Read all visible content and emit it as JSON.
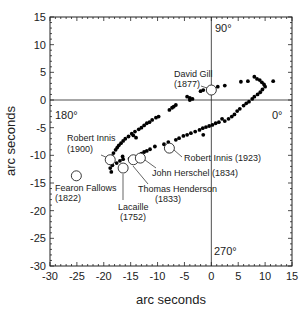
{
  "chart_data": {
    "type": "scatter",
    "title": "",
    "xlabel": "arc seconds",
    "ylabel": "arc seconds",
    "xlim": [
      -30,
      15
    ],
    "ylim": [
      -30,
      15
    ],
    "xticks": [
      -30,
      -25,
      -20,
      -15,
      -10,
      -5,
      0,
      5,
      10,
      15
    ],
    "yticks": [
      -30,
      -25,
      -20,
      -15,
      -10,
      -5,
      0,
      5,
      10,
      15
    ],
    "xtick_labels": [
      "-30",
      "-25",
      "-20",
      "-15",
      "-10",
      "-5",
      "0",
      "5",
      "10",
      "15"
    ],
    "ytick_labels": [
      "-30",
      "-25",
      "-20",
      "-15",
      "-10",
      "-5",
      "0",
      "5",
      "10",
      "15"
    ],
    "grid": false,
    "crosshair": {
      "x": 0,
      "y": 0
    },
    "quadrant_labels": [
      {
        "text": "90°",
        "x": 1,
        "y": 12.5
      },
      {
        "text": "180°",
        "x": -28,
        "y": -2.5
      },
      {
        "text": "0°",
        "x": 11.5,
        "y": -2.5
      },
      {
        "text": "270°",
        "x": 0.8,
        "y": -27.5
      }
    ],
    "series": [
      {
        "name": "observations",
        "marker": "filled-circle",
        "color": "#000000",
        "points": [
          [
            -18.5,
            -10.2
          ],
          [
            -18.2,
            -9.6
          ],
          [
            -17.8,
            -9.0
          ],
          [
            -17.5,
            -8.6
          ],
          [
            -17.2,
            -8.2
          ],
          [
            -16.8,
            -7.8
          ],
          [
            -16.4,
            -7.4
          ],
          [
            -16.0,
            -7.0
          ],
          [
            -15.4,
            -6.6
          ],
          [
            -14.8,
            -6.1
          ],
          [
            -14.2,
            -5.7
          ],
          [
            -13.5,
            -5.3
          ],
          [
            -13.0,
            -5.0
          ],
          [
            -14.0,
            -6.8
          ],
          [
            -12.5,
            -4.6
          ],
          [
            -11.0,
            -3.6
          ],
          [
            -10.3,
            -3.2
          ],
          [
            -9.8,
            -3.0
          ],
          [
            -7.8,
            -1.8
          ],
          [
            -7.3,
            -1.4
          ],
          [
            -7.0,
            -1.2
          ],
          [
            -6.6,
            -0.9
          ],
          [
            -4.5,
            0.6
          ],
          [
            -4.0,
            0.4
          ],
          [
            -2.0,
            1.6
          ],
          [
            -1.5,
            1.8
          ],
          [
            1.2,
            2.4
          ],
          [
            2.5,
            2.6
          ],
          [
            5.5,
            3.3
          ],
          [
            6.8,
            3.4
          ],
          [
            8.0,
            4.2
          ],
          [
            8.5,
            3.8
          ],
          [
            9.0,
            3.6
          ],
          [
            9.4,
            3.2
          ],
          [
            9.8,
            2.8
          ],
          [
            10.0,
            2.4
          ],
          [
            11.5,
            3.4
          ],
          [
            9.5,
            1.9
          ],
          [
            9.1,
            1.4
          ],
          [
            8.6,
            1.0
          ],
          [
            8.0,
            0.6
          ],
          [
            7.6,
            0.2
          ],
          [
            7.0,
            -0.3
          ],
          [
            6.5,
            -0.6
          ],
          [
            6.0,
            -1.0
          ],
          [
            5.3,
            -1.6
          ],
          [
            4.8,
            -2.0
          ],
          [
            4.3,
            -2.6
          ],
          [
            3.8,
            -3.0
          ],
          [
            3.2,
            -3.4
          ],
          [
            2.5,
            -3.8
          ],
          [
            2.0,
            -3.4
          ],
          [
            1.4,
            -4.0
          ],
          [
            0.8,
            -4.2
          ],
          [
            0.2,
            -4.5
          ],
          [
            -0.4,
            -4.7
          ],
          [
            -1.0,
            -4.9
          ],
          [
            -1.6,
            -5.1
          ],
          [
            -2.2,
            -5.4
          ],
          [
            -3.0,
            -5.7
          ],
          [
            -3.8,
            -6.0
          ],
          [
            -4.5,
            -6.3
          ],
          [
            -5.2,
            -6.5
          ],
          [
            -6.0,
            -6.9
          ],
          [
            -6.6,
            -7.2
          ],
          [
            -1.5,
            -6.3
          ],
          [
            -8.0,
            -7.6
          ],
          [
            -8.8,
            -8.0
          ],
          [
            -10.5,
            -8.4
          ],
          [
            -11.4,
            -8.9
          ],
          [
            -12.0,
            -9.2
          ],
          [
            -12.5,
            -9.4
          ],
          [
            -13.0,
            -9.7
          ],
          [
            -16.4,
            -10.7
          ],
          [
            -17.0,
            -11.0
          ],
          [
            -17.6,
            -11.4
          ],
          [
            -18.4,
            -11.8
          ],
          [
            -18.8,
            -12.3
          ],
          [
            -18.6,
            -13.0
          ],
          [
            -16.5,
            -10.2
          ],
          [
            -14.2,
            -10.3
          ],
          [
            -15.2,
            -10.6
          ],
          [
            -4.0,
            0.0
          ],
          [
            -3.5,
            0.2
          ],
          [
            -14.5,
            -6.4
          ],
          [
            -12.0,
            -4.2
          ],
          [
            -11.5,
            -4.0
          ]
        ]
      },
      {
        "name": "historical determinations",
        "marker": "open-circle",
        "color": "#000000",
        "points": [
          {
            "label": "David Gill",
            "year": "(1877)",
            "x": 0.0,
            "y": 1.8
          },
          {
            "label": "Robert Innis",
            "year": "(1900)",
            "x": -18.8,
            "y": -10.8
          },
          {
            "label": "Lacaille",
            "year": "(1752)",
            "x": -16.4,
            "y": -12.3
          },
          {
            "label": "Thomas Henderson",
            "year": "(1833)",
            "x": -14.5,
            "y": -10.8
          },
          {
            "label": "John Herschel",
            "year": "(1834)",
            "x": -13.2,
            "y": -10.5
          },
          {
            "label": "Robert Innis",
            "year": "(1923)",
            "x": -7.8,
            "y": -8.7
          },
          {
            "label": "Fearon Fallows",
            "year": "(1822)",
            "x": -25.1,
            "y": -13.7
          }
        ]
      }
    ]
  },
  "labels": {
    "xlabel": "arc seconds",
    "ylabel": "arc seconds",
    "q90": "90°",
    "q180": "180°",
    "q0": "0°",
    "q270": "270°",
    "gill_name": "David Gill",
    "gill_year": "(1877)",
    "innis1900_name": "Robert Innis",
    "innis1900_year": "(1900)",
    "fallows_name": "Fearon Fallows",
    "fallows_year": "(1822)",
    "lacaille_name": "Lacaille",
    "lacaille_year": "(1752)",
    "henderson_name": "Thomas Henderson",
    "henderson_year": "(1833)",
    "herschel": "John Herschel (1834)",
    "innis1923": "Robert Innis (1923)"
  }
}
